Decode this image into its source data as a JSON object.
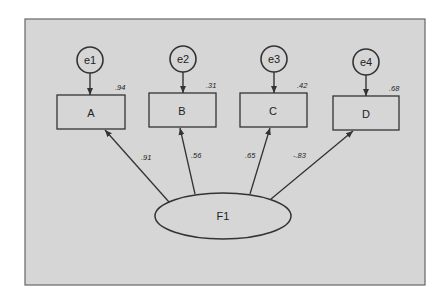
{
  "diagram": {
    "type": "confirmatory-factor-analysis path diagram",
    "background_color": "#d6d6d6",
    "frame_border_color": "#666666",
    "latent_factor": {
      "label": "F1"
    },
    "indicators": [
      {
        "label": "A",
        "error": "e1",
        "r_squared": ".94",
        "loading": ".91"
      },
      {
        "label": "B",
        "error": "e2",
        "r_squared": ".31",
        "loading": ".56"
      },
      {
        "label": "C",
        "error": "e3",
        "r_squared": ".42",
        "loading": ".65"
      },
      {
        "label": "D",
        "error": "e4",
        "r_squared": ".68",
        "loading": "-.83"
      }
    ]
  }
}
